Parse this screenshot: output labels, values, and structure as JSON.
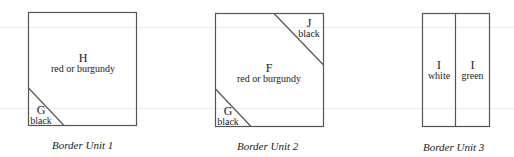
{
  "units": [
    {
      "caption": "Border Unit 1",
      "pieces": [
        {
          "letter": "H",
          "color": "red or burgundy"
        },
        {
          "letter": "G",
          "color": "black"
        }
      ]
    },
    {
      "caption": "Border Unit 2",
      "pieces": [
        {
          "letter": "F",
          "color": "red or burgundy"
        },
        {
          "letter": "J",
          "color": "black"
        },
        {
          "letter": "G",
          "color": "black"
        }
      ]
    },
    {
      "caption": "Border Unit 3",
      "pieces": [
        {
          "letter": "I",
          "color": "white"
        },
        {
          "letter": "I",
          "color": "green"
        }
      ]
    }
  ],
  "style": {
    "line_color": "#555555",
    "background": "#ffffff"
  }
}
